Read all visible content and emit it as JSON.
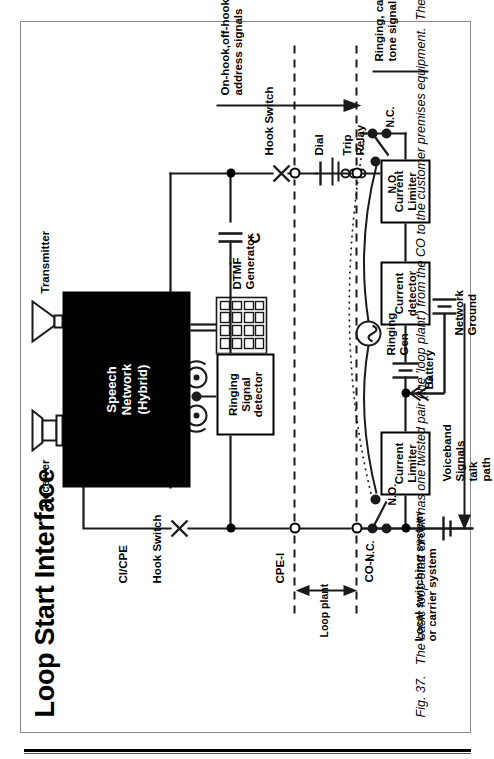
{
  "figure": {
    "title": "Loop Start Interface",
    "caption": "Fig. 37.   The basic loop-start circuit has one twisted pair (the 'loop plant') from the CO to the customer premises equipment.  The CO and the CPE look at the loop with interfaces labeled CO-I and CPE-I."
  },
  "blocks": {
    "speech_network": "Speech\nNetwork\n(Hybrid)",
    "ringing_signal_detector": "Ringing\nSignal\ndetector",
    "current_limiter_left": "Current\nLimiter",
    "current_detector": "Current\ndetector",
    "current_limiter_right": "Current\nLimiter",
    "dtmf_generator": "DTMF\nGenerator"
  },
  "labels": {
    "receiver": "Receiver",
    "transmitter": "Transmitter",
    "hook_switch_top": "Hook Switch",
    "hook_switch_bottom": "Hook Switch",
    "ci_cpe": "CI/CPE",
    "cpe_i": "CPE-I",
    "co_i": "CO-I",
    "loop_plant": "Loop plant",
    "dial": "Dial",
    "capacitor": "C",
    "trip_relay": "Trip\nRelay",
    "ringing_gen": "Ringing\nGen",
    "battery": "Battery",
    "network_ground": "Network\nGround",
    "ground_g": "G",
    "nc_left": "N.C.",
    "no_left": "N.O.",
    "nc_right": "N.C.",
    "no_right": "N.O.",
    "local_switching": "Local switching system\nor carrier system",
    "voiceband": "Voiceband\nSignals\ntalk\npath",
    "on_off_hook": "On-hook,off-hook,\naddress signals",
    "ringing_call_progress": "Ringing, call progress\ntone signals,dc voltage"
  },
  "colors": {
    "ink": "#000000",
    "paper": "#ffffff",
    "frame": "#8a8a8a"
  }
}
